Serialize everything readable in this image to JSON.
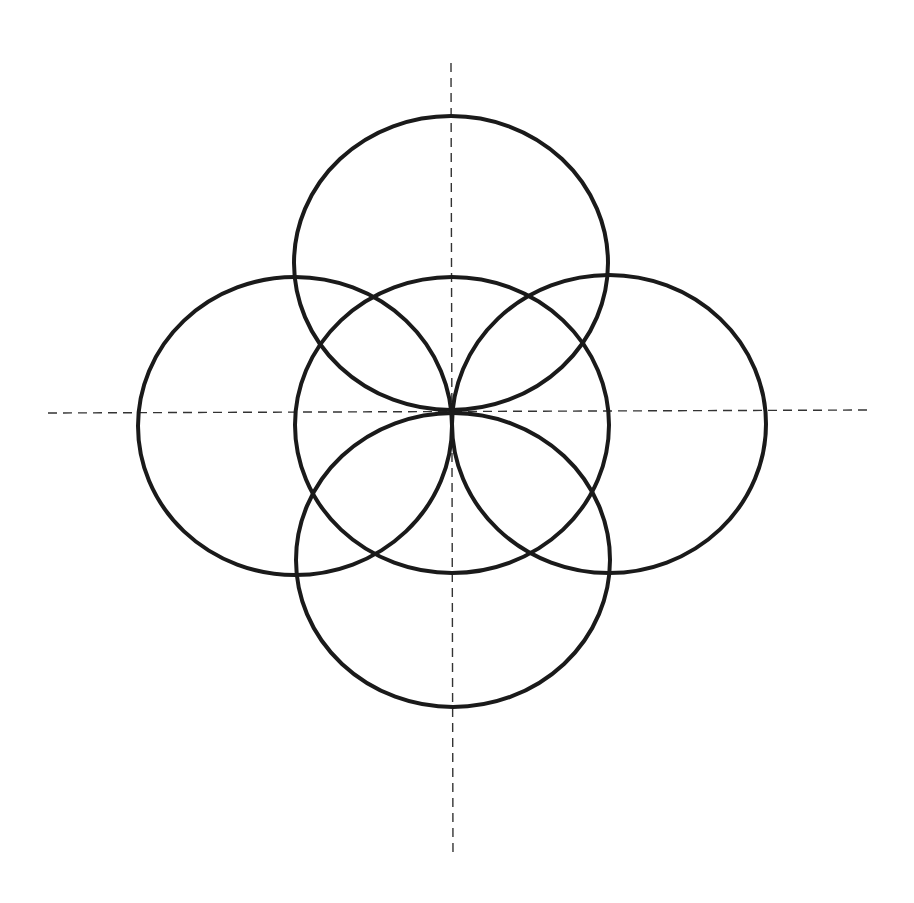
{
  "diagram": {
    "background": "#ffffff",
    "stroke_color": "#1a1a1a",
    "axis_color": "#333333",
    "circle_stroke_width": 4,
    "axis_stroke_width": 1.4,
    "axis_dash": "9 6",
    "axes": [
      {
        "name": "horizontal-axis",
        "x1": 48,
        "y1": 413,
        "x2": 870,
        "y2": 410
      },
      {
        "name": "vertical-axis",
        "x1": 451,
        "y1": 63,
        "x2": 453,
        "y2": 858
      }
    ],
    "circles": [
      {
        "name": "top-circle",
        "cx": 451,
        "cy": 263,
        "rx": 157,
        "ry": 147
      },
      {
        "name": "left-circle",
        "cx": 295,
        "cy": 426,
        "rx": 157,
        "ry": 149
      },
      {
        "name": "center-circle",
        "cx": 452,
        "cy": 425,
        "rx": 157,
        "ry": 148
      },
      {
        "name": "right-circle",
        "cx": 609,
        "cy": 424,
        "rx": 157,
        "ry": 149
      },
      {
        "name": "bottom-circle",
        "cx": 453,
        "cy": 560,
        "rx": 157,
        "ry": 147
      }
    ]
  }
}
